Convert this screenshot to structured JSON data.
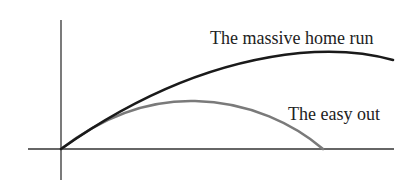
{
  "diagram": {
    "title": "",
    "curves": [
      {
        "id": "home-run",
        "label": "The massive home run",
        "color": "#1a1a1a"
      },
      {
        "id": "easy-out",
        "label": "The easy out",
        "color": "#7a7a7a"
      }
    ],
    "axes": {
      "x_axis": true,
      "y_axis": true,
      "color": "#333333"
    }
  }
}
